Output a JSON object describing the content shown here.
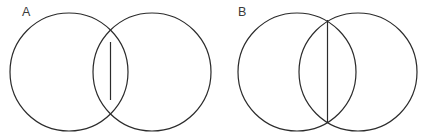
{
  "figure": {
    "background_color": "#ffffff",
    "stroke_color": "#2b2b2b",
    "stroke_width": 1.2,
    "fill_color": "none",
    "width": 423,
    "height": 139,
    "panels": [
      {
        "id": "A",
        "label": "A",
        "label_x": 22,
        "label_y": 16,
        "description": "Two equal circles with a shallow overlap; the lens-shaped intersection is narrow and the shared chord is short.",
        "circle_radius": 59,
        "left_circle": {
          "cx": 69,
          "cy": 72,
          "r": 59
        },
        "right_circle": {
          "cx": 152,
          "cy": 72,
          "r": 59
        },
        "center_distance": 83,
        "overlap_width": 35,
        "chord": {
          "x": 110.5,
          "y1": 42,
          "y2": 100,
          "length": 58
        },
        "bounds": {
          "x_min": 10,
          "x_max": 211,
          "y_min": 13,
          "y_max": 131
        }
      },
      {
        "id": "B",
        "label": "B",
        "label_x": 238,
        "label_y": 16,
        "description": "Two equal circles with a deeper overlap; the lens-shaped intersection is wide and the shared chord is long.",
        "circle_radius": 59,
        "left_circle": {
          "cx": 297,
          "cy": 72,
          "r": 59
        },
        "right_circle": {
          "cx": 358,
          "cy": 72,
          "r": 59
        },
        "center_distance": 61,
        "overlap_width": 57,
        "chord": {
          "x": 327.5,
          "y1": 20,
          "y2": 123,
          "length": 103
        },
        "bounds": {
          "x_min": 238,
          "x_max": 417,
          "y_min": 13,
          "y_max": 131
        }
      }
    ]
  },
  "chart_data": {
    "type": "diagram",
    "subtitle": "",
    "xlabel": "",
    "ylabel": "",
    "legend": [],
    "annotations": [
      "A",
      "B"
    ],
    "shapes": [
      {
        "panel": "A",
        "shape": "circle",
        "cx": 69,
        "cy": 72,
        "r": 59
      },
      {
        "panel": "A",
        "shape": "circle",
        "cx": 152,
        "cy": 72,
        "r": 59
      },
      {
        "panel": "A",
        "shape": "line",
        "x1": 110.5,
        "y1": 42,
        "x2": 110.5,
        "y2": 100
      },
      {
        "panel": "B",
        "shape": "circle",
        "cx": 297,
        "cy": 72,
        "r": 59
      },
      {
        "panel": "B",
        "shape": "circle",
        "cx": 358,
        "cy": 72,
        "r": 59
      },
      {
        "panel": "B",
        "shape": "line",
        "x1": 327.5,
        "y1": 20,
        "x2": 327.5,
        "y2": 123
      }
    ]
  }
}
